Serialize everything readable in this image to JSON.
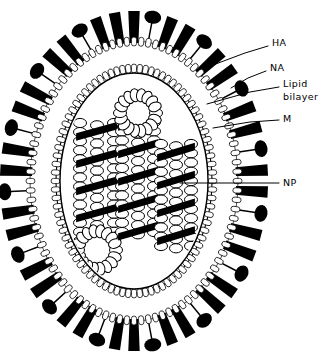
{
  "figure": {
    "background_color": "#ffffff",
    "ink_color": "#000000",
    "width": 329,
    "height": 359
  },
  "virion": {
    "center_x": 134,
    "center_y": 181,
    "outer_membrane_rx": 104,
    "outer_membrane_ry": 140,
    "membrane_thickness": 20,
    "inner_cavity_rx": 74,
    "inner_cavity_ry": 108
  },
  "labels": [
    {
      "id": "ha",
      "text": "HA",
      "text_x": 272,
      "text_y": 43,
      "leader": [
        [
          268,
          46
        ],
        [
          245,
          53
        ],
        [
          205,
          68
        ]
      ]
    },
    {
      "id": "na",
      "text": "NA",
      "text_x": 270,
      "text_y": 68,
      "leader": [
        [
          266,
          71
        ],
        [
          248,
          78
        ],
        [
          231,
          88
        ]
      ]
    },
    {
      "id": "lipid-bilayer",
      "text": "Lipid",
      "text_x": 283,
      "text_y": 84,
      "leader": [
        [
          279,
          87
        ],
        [
          250,
          92
        ],
        [
          207,
          104
        ]
      ]
    },
    {
      "id": "lipid-bilayer-2",
      "text": "bilayer",
      "text_x": 283,
      "text_y": 97,
      "leader": null
    },
    {
      "id": "m",
      "text": "M",
      "text_x": 283,
      "text_y": 119,
      "leader": [
        [
          279,
          120
        ],
        [
          250,
          122
        ],
        [
          213,
          128
        ]
      ]
    },
    {
      "id": "np",
      "text": "NP",
      "text_x": 283,
      "text_y": 183,
      "leader": [
        [
          279,
          183
        ],
        [
          230,
          183
        ],
        [
          180,
          183
        ]
      ]
    }
  ],
  "spikes": {
    "ha_label": "HA",
    "na_label": "NA",
    "count": 46,
    "na_interval": 3,
    "ha_rod_length": 30,
    "ha_rod_width": 11,
    "na_stalk_length": 20,
    "na_head_rx": 8.5,
    "na_head_ry": 6.5
  },
  "membrane": {
    "label": "Lipid bilayer",
    "outer_leaflet_count": 92,
    "inner_leaflet_count": 84,
    "lipid_length": 9,
    "lipid_width": 2.6
  },
  "matrix": {
    "label": "M",
    "description": "matrix protein layer lining inner membrane"
  },
  "rnp_segments": {
    "label": "NP",
    "description": "helical ribonucleoprotein segments",
    "items": [
      {
        "id": "seg-left",
        "cx": 97,
        "top": 123,
        "bottom": 250,
        "width": 34,
        "loop": "bottom",
        "loop_r": 19
      },
      {
        "id": "seg-center",
        "cx": 138,
        "top": 113,
        "bottom": 232,
        "width": 32,
        "loop": "top",
        "loop_r": 18
      },
      {
        "id": "seg-right",
        "cx": 176,
        "top": 144,
        "bottom": 246,
        "width": 30,
        "loop": "none",
        "loop_r": 0
      }
    ],
    "bead_rows": 13,
    "bead_rx": 6.5,
    "bead_ry": 4.6
  }
}
